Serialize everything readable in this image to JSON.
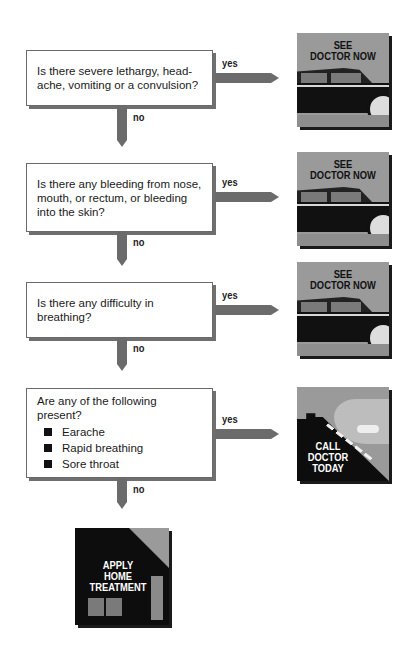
{
  "flowchart": {
    "steps": [
      {
        "question": "Is there severe lethargy, head-\nache, vomiting or a convulsion?",
        "yes_label": "yes",
        "no_label": "no",
        "yes_outcome": "SEE\nDOCTOR NOW"
      },
      {
        "question": "Is there any bleeding from nose,\nmouth, or rectum, or bleeding\ninto the skin?",
        "yes_label": "yes",
        "no_label": "no",
        "yes_outcome": "SEE\nDOCTOR NOW"
      },
      {
        "question": "Is there any difficulty in\nbreathing?",
        "yes_label": "yes",
        "no_label": "no",
        "yes_outcome": "SEE\nDOCTOR NOW"
      },
      {
        "question": "Are any of the following present?",
        "items": [
          "Earache",
          "Rapid breathing",
          "Sore throat"
        ],
        "yes_label": "yes",
        "no_label": "no",
        "yes_outcome": "CALL\nDOCTOR\nTODAY"
      }
    ],
    "final_outcome": "APPLY\nHOME\nTREATMENT"
  },
  "icons": {
    "see_doctor": "car-icon",
    "call_doctor": "phone-icon",
    "home_treatment": "house-icon"
  },
  "colors": {
    "arrow": "#6b6b6b",
    "image_gray": "#9a9a9a",
    "image_black": "#0d0d0d"
  }
}
